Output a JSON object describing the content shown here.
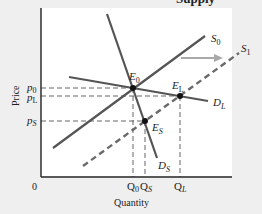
{
  "title_fragment": "Supply",
  "axes": {
    "x_label": "Quantity",
    "y_label": "Price",
    "origin_label": "0"
  },
  "curves": {
    "S0": {
      "label": "S",
      "sub": "0",
      "style": "solid"
    },
    "S1": {
      "label": "S",
      "sub": "1",
      "style": "dashed"
    },
    "DL": {
      "label": "D",
      "sub": "L",
      "style": "solid"
    },
    "DS": {
      "label": "D",
      "sub": "S",
      "style": "solid"
    }
  },
  "points": {
    "E0": {
      "label": "E",
      "sub": "0"
    },
    "EL": {
      "label": "E",
      "sub": "L"
    },
    "ES": {
      "label": "E",
      "sub": "S"
    }
  },
  "price_ticks": [
    {
      "label": "p",
      "sub": "0"
    },
    {
      "label": "p",
      "sub": "L"
    },
    {
      "label": "p",
      "sub": "S"
    }
  ],
  "quantity_ticks": [
    {
      "label": "Q",
      "sub": "0"
    },
    {
      "label": "Q",
      "sub": "S"
    },
    {
      "label": "Q",
      "sub": "L"
    }
  ],
  "shift_arrow": {
    "direction": "right",
    "color": "#a9a9a9"
  },
  "colors": {
    "curve": "#555555",
    "axis": "#222222",
    "guide": "#555555",
    "plot_bg": "#ffffff",
    "page_bg": "#efefef"
  }
}
